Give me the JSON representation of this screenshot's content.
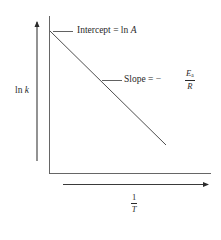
{
  "diagram": {
    "type": "arrhenius-plot",
    "y_axis": {
      "label_prefix": "ln",
      "label_var": "k"
    },
    "x_axis": {
      "numerator": "1",
      "denominator": "T"
    },
    "intercept_label": {
      "text": "Intercept = ln",
      "var": "A"
    },
    "slope_label": {
      "text": "Slope",
      "equals": "= −",
      "numerator_var": "E",
      "numerator_sub": "a",
      "denominator_var": "R"
    },
    "line": {
      "start": [
        50,
        31
      ],
      "end": [
        166,
        145
      ]
    },
    "colors": {
      "ink": "#2a2a2a",
      "line": "#3a3a3a",
      "background": "#ffffff"
    }
  }
}
